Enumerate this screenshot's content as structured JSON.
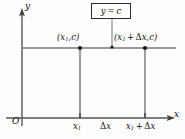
{
  "figure": {
    "colors": {
      "background": "#fdfdfd",
      "axis": "#55555a",
      "line": "#6a6a70",
      "marker": "#1a1a1a",
      "box_border": "#2b2b2b",
      "text": "#111111"
    },
    "axes": {
      "y_label": "y",
      "x_label": "x",
      "origin_label": "O"
    },
    "function_box": {
      "label": "y = c",
      "lhs": "y",
      "equals": "=",
      "rhs": "c"
    },
    "points": [
      {
        "name": "left-point",
        "label": "(x1,c)",
        "x_part": "x",
        "x_sub": "1",
        "y_part": "c",
        "px": 80,
        "py": 48
      },
      {
        "name": "right-point",
        "label": "(x1 + Δx,c)",
        "x_part": "x",
        "x_sub": "1",
        "delta": "Δ",
        "delta_var": "x",
        "y_part": "c",
        "px": 145,
        "py": 48
      }
    ],
    "x_ticks": [
      {
        "name": "tick-x1",
        "label": "x1",
        "base": "x",
        "sub": "1",
        "px": 80
      },
      {
        "name": "tick-x1-plus-dx",
        "label": "x1 + Δx",
        "base": "x",
        "sub": "1",
        "plus": "+",
        "delta": "Δ",
        "delta_var": "x",
        "px": 145
      }
    ],
    "interval_label": {
      "name": "delta-x",
      "delta": "Δ",
      "var": "x",
      "label": "Δx"
    },
    "geometry": {
      "y_axis_x": 22,
      "x_axis_y": 118,
      "constant_line_y": 48,
      "constant_line_x_end": 176,
      "leader_line_x": 112,
      "leader_top_y": 19,
      "leader_bottom_y": 48
    }
  }
}
